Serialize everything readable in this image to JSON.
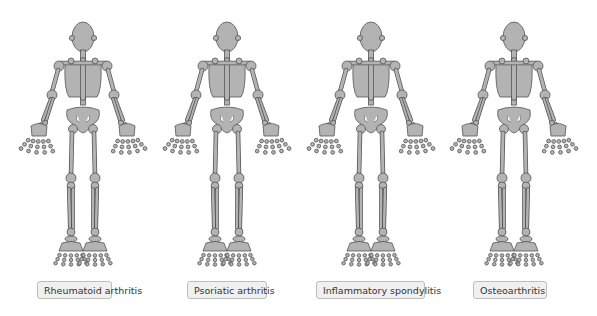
{
  "colors": {
    "bone_fill": "#b3b3b3",
    "bone_stroke": "#555555",
    "label_bg": "#f0f0f0",
    "label_border": "#bdbdbd"
  },
  "panels": [
    {
      "label": "Rheumatoid arthritis",
      "center_x": 83,
      "label_left": 37,
      "label_width": 75
    },
    {
      "label": "Psoriatic arthritis",
      "center_x": 227,
      "label_left": 187,
      "label_width": 80
    },
    {
      "label": "Inflammatory spondylitis",
      "center_x": 371,
      "label_left": 316,
      "label_width": 109
    },
    {
      "label": "Osteoarthritis",
      "center_x": 514,
      "label_left": 473,
      "label_width": 74
    }
  ]
}
